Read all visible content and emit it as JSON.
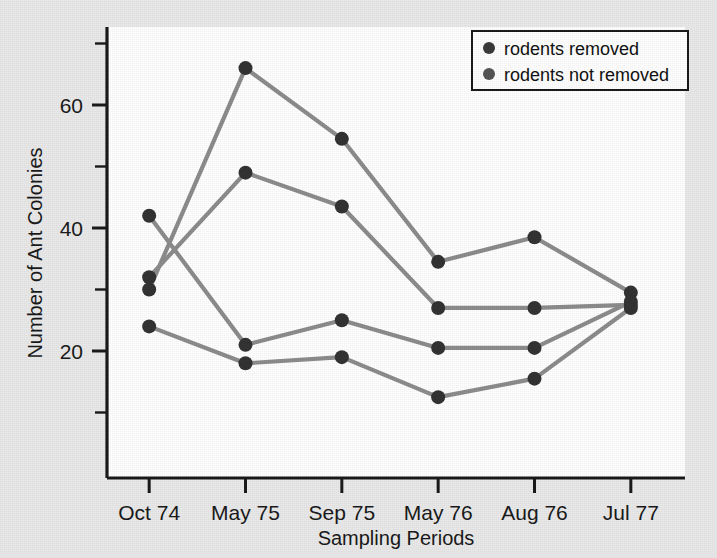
{
  "figure": {
    "background_color": "#e9e9e9",
    "plot_background_color": "#ffffff",
    "axis_color": "#1a1a1a",
    "line_color": "#8c8c8c",
    "marker_color": "#333333"
  },
  "legend": {
    "position": "top-right",
    "border_color": "#1a1a1a",
    "background_color": "#ffffff",
    "entries": [
      {
        "label": "rodents removed",
        "marker": "circle",
        "color": "#3a3a3a"
      },
      {
        "label": "rodents not removed",
        "marker": "circle",
        "color": "#555555"
      }
    ]
  },
  "chart_data": {
    "type": "line",
    "title": "",
    "xlabel": "Sampling Periods",
    "ylabel": "Number of Ant Colonies",
    "categories": [
      "Oct 74",
      "May 75",
      "Sep 75",
      "May 76",
      "Aug 76",
      "Jul 77"
    ],
    "ylim": [
      0,
      70
    ],
    "yticks": [
      20,
      40,
      60
    ],
    "yticks_minor": [
      10,
      30,
      50,
      70
    ],
    "grid": false,
    "legend_position": "top-right",
    "series": [
      {
        "name": "rodents removed (plot A)",
        "group": "rodents removed",
        "values": [
          30,
          66,
          54.5,
          34.5,
          38.5,
          29.5
        ]
      },
      {
        "name": "rodents not removed (plot B)",
        "group": "rodents not removed",
        "values": [
          32,
          49,
          43.5,
          27,
          27,
          27.5
        ]
      },
      {
        "name": "rodents removed (plot C)",
        "group": "rodents removed",
        "values": [
          42,
          21,
          25,
          20.5,
          20.5,
          28
        ]
      },
      {
        "name": "rodents not removed (plot D)",
        "group": "rodents not removed",
        "values": [
          24,
          18,
          19,
          12.5,
          15.5,
          27
        ]
      }
    ]
  }
}
